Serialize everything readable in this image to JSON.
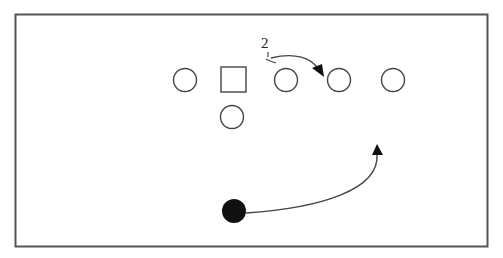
{
  "diagram": {
    "type": "football-play-diagram",
    "border_color": "#555555",
    "stroke_color": "#444444",
    "players": [
      {
        "id": "o1",
        "shape": "circle",
        "x": 185,
        "y": 80
      },
      {
        "id": "center",
        "shape": "square",
        "x": 233,
        "y": 80
      },
      {
        "id": "o3",
        "shape": "circle",
        "x": 286,
        "y": 80
      },
      {
        "id": "o4",
        "shape": "circle",
        "x": 339,
        "y": 80
      },
      {
        "id": "o5",
        "shape": "circle",
        "x": 393,
        "y": 80
      },
      {
        "id": "qb",
        "shape": "circle",
        "x": 232,
        "y": 117
      },
      {
        "id": "ball-carrier",
        "shape": "filled-circle",
        "x": 234,
        "y": 211
      }
    ],
    "annotations": [
      {
        "id": "count-label",
        "text": "2",
        "x": 264,
        "y": 36
      }
    ],
    "routes": [
      {
        "id": "pull-route",
        "from": "o3-tick",
        "to": "o4",
        "arrow": true
      },
      {
        "id": "run-route",
        "from": "ball-carrier",
        "to": "upfield",
        "arrow": true
      }
    ]
  }
}
